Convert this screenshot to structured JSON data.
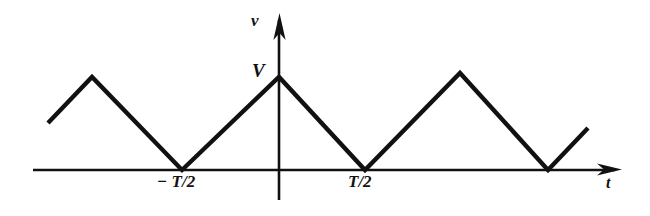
{
  "figure": {
    "background_color": "#ffffff",
    "ink_color": "#111111",
    "labels": {
      "y_axis": "v",
      "x_axis": "t",
      "amplitude": "V",
      "neg_half_period": "− T/2",
      "pos_half_period": "T/2"
    }
  },
  "chart_data": {
    "type": "line",
    "title": "",
    "xlabel": "t",
    "ylabel": "v",
    "grid": false,
    "legend": null,
    "annotations": [
      {
        "text": "V",
        "role": "amplitude-level",
        "x": 0,
        "y": 1
      },
      {
        "text": "− T/2",
        "role": "x-tick",
        "x": -0.5,
        "y": 0
      },
      {
        "text": "T/2",
        "role": "x-tick",
        "x": 0.5,
        "y": 0
      }
    ],
    "xlim": [
      -1.2,
      1.8
    ],
    "ylim": [
      0,
      1.25
    ],
    "x_tick_labels": [
      "− T/2",
      "T/2"
    ],
    "x_tick_values": [
      -0.5,
      0.5
    ],
    "y_tick_labels": [
      "V"
    ],
    "y_tick_values": [
      1
    ],
    "series": [
      {
        "name": "v(t)",
        "description": "Triangular wave, peak amplitude V, period T, zeros at odd multiples of T/2",
        "x": [
          -1.19,
          -0.97,
          -0.5,
          0.0,
          0.5,
          0.99,
          1.45,
          1.66
        ],
        "y": [
          0.5,
          1.0,
          0.0,
          1.0,
          0.0,
          1.04,
          0.0,
          0.45
        ],
        "pixel_points": [
          [
            48,
            123
          ],
          [
            92,
            77
          ],
          [
            182,
            170
          ],
          [
            279,
            77
          ],
          [
            365,
            170
          ],
          [
            460,
            73
          ],
          [
            548,
            170
          ],
          [
            588,
            128
          ]
        ]
      }
    ],
    "axes": {
      "x_axis_pixel": {
        "y": 170,
        "x_start": 33,
        "x_end": 622,
        "arrow": "right"
      },
      "y_axis_pixel": {
        "x": 279,
        "y_start": 13,
        "y_end": 200,
        "arrow": "up"
      }
    }
  }
}
